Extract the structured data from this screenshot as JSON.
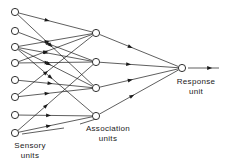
{
  "diagram": {
    "type": "neural-network-schematic",
    "background_color": "#ffffff",
    "line_color": "#1a1a1a",
    "node_fill_color": "#ffffff",
    "width": 228,
    "height": 166,
    "labels": {
      "sensory": {
        "line1": "Sensory",
        "line2": "units",
        "x": 30,
        "y": 148
      },
      "association": {
        "line1": "Association",
        "line2": "units",
        "x": 108,
        "y": 131
      },
      "response": {
        "line1": "Response",
        "line2": "unit",
        "x": 196,
        "y": 84
      }
    },
    "layers": [
      {
        "name": "sensory-layer",
        "label_key": "sensory",
        "radius": 3.6,
        "nodes": [
          {
            "id": "s1",
            "cx": 15,
            "cy": 12
          },
          {
            "id": "s2",
            "cx": 15,
            "cy": 31
          },
          {
            "id": "s3",
            "cx": 15,
            "cy": 47
          },
          {
            "id": "s4",
            "cx": 15,
            "cy": 63
          },
          {
            "id": "s5",
            "cx": 15,
            "cy": 80
          },
          {
            "id": "s6",
            "cx": 15,
            "cy": 97
          },
          {
            "id": "s7",
            "cx": 15,
            "cy": 115
          },
          {
            "id": "s8",
            "cx": 15,
            "cy": 133
          }
        ]
      },
      {
        "name": "association-layer",
        "label_key": "association",
        "radius": 3.6,
        "nodes": [
          {
            "id": "a1",
            "cx": 96,
            "cy": 33
          },
          {
            "id": "a2",
            "cx": 96,
            "cy": 62
          },
          {
            "id": "a3",
            "cx": 96,
            "cy": 88
          },
          {
            "id": "a4",
            "cx": 96,
            "cy": 116
          }
        ]
      },
      {
        "name": "response-layer",
        "label_key": "response",
        "radius": 3.6,
        "nodes": [
          {
            "id": "r1",
            "cx": 182,
            "cy": 68
          }
        ]
      }
    ],
    "edges": [
      {
        "from": "s1",
        "to": "a1",
        "arrow_at": 0.42
      },
      {
        "from": "s1",
        "to": "a3",
        "arrow_at": 0.46
      },
      {
        "from": "s2",
        "to": "a2",
        "arrow_at": 0.44
      },
      {
        "from": "s3",
        "to": "a1",
        "arrow_at": 0.42
      },
      {
        "from": "s3",
        "to": "a2",
        "arrow_at": 0.4
      },
      {
        "from": "s3",
        "to": "a3",
        "arrow_at": 0.44
      },
      {
        "from": "s3",
        "to": "a4",
        "arrow_at": 0.46
      },
      {
        "from": "s4",
        "to": "a1",
        "arrow_at": 0.4
      },
      {
        "from": "s4",
        "to": "a2",
        "arrow_at": 0.42
      },
      {
        "from": "s5",
        "to": "a3",
        "arrow_at": 0.46
      },
      {
        "from": "s6",
        "to": "a1",
        "arrow_at": 0.4
      },
      {
        "from": "s6",
        "to": "a3",
        "arrow_at": 0.42
      },
      {
        "from": "s7",
        "to": "a4",
        "arrow_at": 0.44
      },
      {
        "from": "s8",
        "to": "a2",
        "arrow_at": 0.4
      },
      {
        "from": "s8",
        "to": "a4",
        "arrow_at": 0.44
      },
      {
        "from": "a1",
        "to": "r1",
        "arrow_at": 0.42
      },
      {
        "from": "a2",
        "to": "r1",
        "arrow_at": 0.4
      },
      {
        "from": "a3",
        "to": "r1",
        "arrow_at": 0.42
      },
      {
        "from": "a4",
        "to": "r1",
        "arrow_at": 0.44
      }
    ],
    "output_arrow": {
      "from_x": 188,
      "to_x": 219,
      "y": 68,
      "arrow_at": 0.78
    },
    "leader_lines": [
      {
        "name": "sensory-leader",
        "x1": 22,
        "y1": 134,
        "x2": 64,
        "y2": 128
      },
      {
        "name": "association-leader",
        "x1": 96,
        "y1": 119,
        "x2": 80,
        "y2": 124
      }
    ]
  }
}
